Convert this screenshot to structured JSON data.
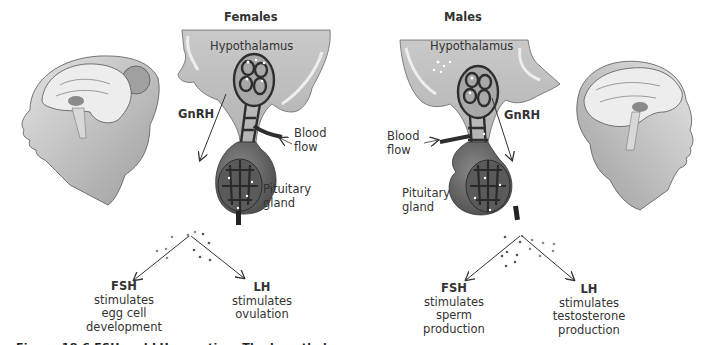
{
  "panels": {
    "female": {
      "title": "Females",
      "hypothalamus": "Hypothalamus",
      "gnrh": "GnRH",
      "blood_flow": [
        "Blood",
        "flow"
      ],
      "pituitary": [
        "Pituitary",
        "gland"
      ],
      "fsh": {
        "name": "FSH",
        "effect": [
          "stimulates",
          "egg cell",
          "development"
        ]
      },
      "lh": {
        "name": "LH",
        "effect": [
          "stimulates",
          "ovulation"
        ]
      }
    },
    "male": {
      "title": "Males",
      "hypothalamus": "Hypothalamus",
      "gnrh": "GnRH",
      "blood_flow": [
        "Blood",
        "flow"
      ],
      "pituitary": [
        "Pituitary",
        "gland"
      ],
      "fsh": {
        "name": "FSH",
        "effect": [
          "stimulates",
          "sperm",
          "production"
        ]
      },
      "lh": {
        "name": "LH",
        "effect": [
          "stimulates",
          "testosterone",
          "production"
        ]
      }
    }
  },
  "caption_fragment": "Figure 18.6   FSH and LH secretion.   The hypothalamus",
  "colors": {
    "tissue": "#bdbdbd",
    "tissue_light": "#d9d9d9",
    "vessel": "#2e2e2e",
    "gland": "#6e6e6e",
    "gland_dark": "#545454",
    "skin": "#cfcfcf",
    "brain": "#ececec",
    "arrow": "#3a3a3a"
  }
}
